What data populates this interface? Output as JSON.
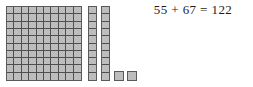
{
  "equation": {
    "text": "55 + 67 = 122",
    "addend_1": 55,
    "addend_2": 67,
    "sum": 122
  },
  "manipulatives": {
    "label": "base-ten-blocks",
    "fill_color": "#b9b9b9",
    "line_color": "#4f4f4f",
    "hundreds_flat": {
      "count": 1,
      "rows": 10,
      "columns": 10,
      "value": 100
    },
    "tens_rods": {
      "count": 2,
      "segments_each": 10,
      "value": 20
    },
    "ones_units": {
      "count": 2,
      "value": 2
    },
    "total_value": 122
  }
}
